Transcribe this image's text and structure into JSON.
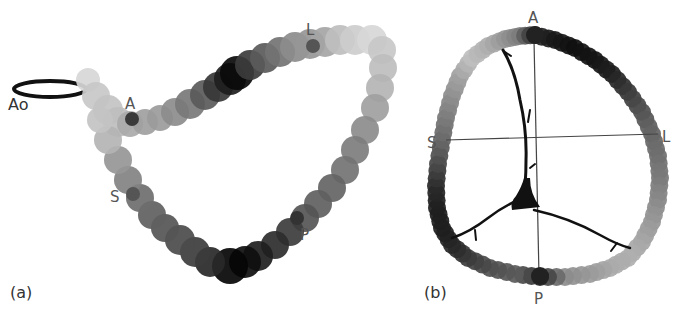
{
  "figure": {
    "panel_a": {
      "label": "(a)",
      "aorta_label": "Ao",
      "markers": {
        "A": "A",
        "L": "L",
        "S": "S",
        "P": "P"
      }
    },
    "panel_b": {
      "label": "(b)",
      "markers": {
        "A": "A",
        "L": "L",
        "S": "S",
        "P": "P"
      }
    }
  },
  "chart_data": {
    "type": "diagram",
    "title": "",
    "panels": [
      {
        "id": "a",
        "label": "(a)",
        "description": "3D annulus loop rendered as overlapping grey-scale discs (shade encodes value) with aortic ring 'Ao'",
        "annotations": [
          "Ao",
          "A",
          "L",
          "S",
          "P"
        ]
      },
      {
        "id": "b",
        "label": "(b)",
        "description": "Annulus projected in plane with A-P and S-L axes, grey-scale discs around perimeter, branching black structure inside",
        "annotations": [
          "A",
          "L",
          "S",
          "P"
        ]
      }
    ]
  }
}
